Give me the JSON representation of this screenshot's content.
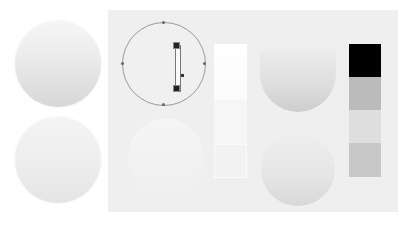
{
  "preview": {
    "balls": [
      {
        "name": "gradient-ball-top",
        "top_color": "#f6f6f6",
        "bottom_color": "#d7d7d7"
      },
      {
        "name": "gradient-ball-bottom",
        "top_color": "#f4f4f4",
        "bottom_color": "#e4e4e4"
      }
    ]
  },
  "editor": {
    "panel_color": "#efefef",
    "circle_outline_color": "#9a9a9a"
  },
  "swatches": [
    {
      "name": "swatch-black",
      "color": "#000000"
    },
    {
      "name": "swatch-gray",
      "color": "#bbbbbb"
    },
    {
      "name": "swatch-light",
      "color": "#dedede"
    },
    {
      "name": "swatch-mid",
      "color": "#c8c8c8"
    }
  ]
}
